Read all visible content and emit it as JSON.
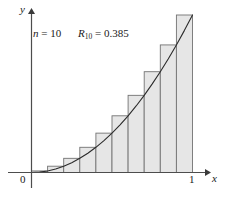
{
  "figure": {
    "name": "riemann-sum-right-endpoints",
    "background_color": "#ffffff"
  },
  "annotations": {
    "n_label_var": "n",
    "n_label_eq": " = ",
    "n_label_value": "10",
    "r_label_var": "R",
    "r_label_sub": "10",
    "r_label_eq": " = ",
    "r_label_value": "0.385"
  },
  "axes": {
    "x_label": "x",
    "y_label": "y",
    "origin_label": "0",
    "x_tick_label": "1"
  },
  "style": {
    "bar_fill": "#e6e6e6",
    "bar_stroke": "#737373",
    "curve_color": "#2b2b2b",
    "axis_color": "#4d4d4d",
    "text_color": "#1a1a1a"
  },
  "chart_data": {
    "type": "bar",
    "title": "",
    "subtitle": "",
    "xlabel": "x",
    "ylabel": "y",
    "xlim": [
      0,
      1
    ],
    "ylim": [
      0,
      1
    ],
    "grid": false,
    "legend": "none",
    "n": 10,
    "riemann_sum": 0.385,
    "method": "right-endpoint",
    "function": "y = x^2",
    "categories": [
      "0.0-0.1",
      "0.1-0.2",
      "0.2-0.3",
      "0.3-0.4",
      "0.4-0.5",
      "0.5-0.6",
      "0.6-0.7",
      "0.7-0.8",
      "0.8-0.9",
      "0.9-1.0"
    ],
    "x_left": [
      0.0,
      0.1,
      0.2,
      0.3,
      0.4,
      0.5,
      0.6,
      0.7,
      0.8,
      0.9
    ],
    "x_right": [
      0.1,
      0.2,
      0.3,
      0.4,
      0.5,
      0.6,
      0.7,
      0.8,
      0.9,
      1.0
    ],
    "values": [
      0.01,
      0.04,
      0.09,
      0.16,
      0.25,
      0.36,
      0.49,
      0.64,
      0.81,
      1.0
    ],
    "bar_width": 0.1,
    "curve": {
      "name": "y = x^2",
      "x": [
        0.0,
        0.05,
        0.1,
        0.15,
        0.2,
        0.25,
        0.3,
        0.35,
        0.4,
        0.45,
        0.5,
        0.55,
        0.6,
        0.65,
        0.7,
        0.75,
        0.8,
        0.85,
        0.9,
        0.95,
        1.0
      ],
      "y": [
        0.0,
        0.0025,
        0.01,
        0.0225,
        0.04,
        0.0625,
        0.09,
        0.1225,
        0.16,
        0.2025,
        0.25,
        0.3025,
        0.36,
        0.4225,
        0.49,
        0.5625,
        0.64,
        0.7225,
        0.81,
        0.9025,
        1.0
      ]
    }
  }
}
